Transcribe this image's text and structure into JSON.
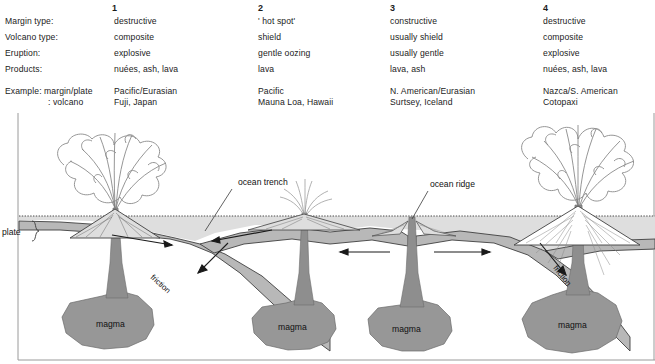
{
  "table": {
    "row_labels": [
      "Margin type:",
      "Volcano type:",
      "Eruption:",
      "Products:",
      "Example: margin/plate",
      ": volcano"
    ],
    "columns": [
      {
        "number": "1",
        "margin_type": "destructive",
        "volcano_type": "composite",
        "eruption": "explosive",
        "products": "nuées, ash, lava",
        "example_margin_plate": "Pacific/Eurasian",
        "example_volcano": "Fuji, Japan"
      },
      {
        "number": "2",
        "margin_type": "' hot spot'",
        "volcano_type": "shield",
        "eruption": "gentle oozing",
        "products": "lava",
        "example_margin_plate": "Pacific",
        "example_volcano": "Mauna Loa, Hawaii"
      },
      {
        "number": "3",
        "margin_type": "constructive",
        "volcano_type": "usually shield",
        "eruption": "usually gentle",
        "products": "lava, ash",
        "example_margin_plate": "N. American/Eurasian",
        "example_volcano": "Surtsey, Iceland"
      },
      {
        "number": "4",
        "margin_type": "destructive",
        "volcano_type": "composite",
        "eruption": "explosive",
        "products": "nuées, ash, lava",
        "example_margin_plate": "Nazca/S. American",
        "example_volcano": "Cotopaxi"
      }
    ]
  },
  "diagram": {
    "labels": {
      "plate": "plate",
      "ocean_trench": "ocean trench",
      "ocean_ridge": "ocean ridge",
      "friction_left": "friction",
      "friction_right": "friction",
      "magma_1": "magma",
      "magma_2": "magma",
      "magma_3": "magma",
      "magma_4": "magma"
    },
    "colors": {
      "water": "#dcdcdc",
      "lithosphere": "#b4b4b4",
      "magma": "#969696",
      "outline": "#3c3c3c",
      "border": "#8c8c8c",
      "background": "#ffffff"
    }
  }
}
